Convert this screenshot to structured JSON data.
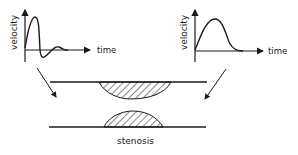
{
  "left_plot": {
    "ylabel": "velocity",
    "xlabel": "time",
    "curve": "oscillating pulse with damped ringing"
  },
  "right_plot": {
    "ylabel": "velocity",
    "xlabel": "time",
    "curve": "smooth broad single pulse"
  },
  "vessel_label": "stenosis",
  "colors": {
    "ink": "#1a1a1a",
    "background": "#ffffff"
  }
}
